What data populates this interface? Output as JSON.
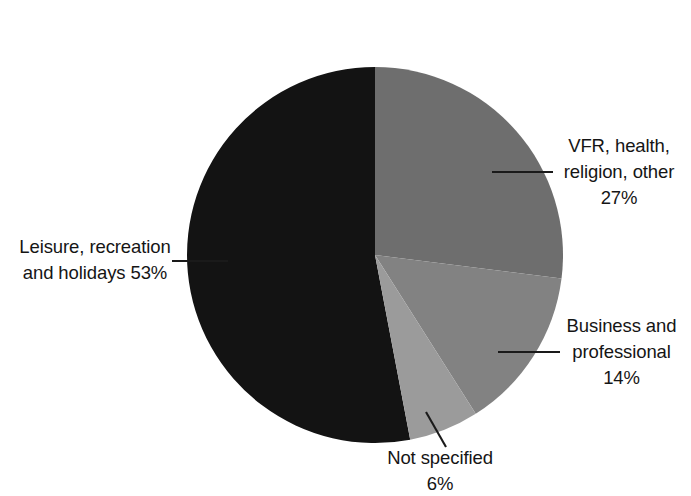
{
  "chart_data": {
    "type": "pie",
    "title": "",
    "subtitle": "",
    "xlabel": "",
    "ylabel": "",
    "legend_position": "none",
    "grid": false,
    "start_angle_deg": 0,
    "direction": "clockwise",
    "categories": [
      "VFR, health, religion, other",
      "Business and professional",
      "Not specified",
      "Leisure, recreation and holidays"
    ],
    "values": [
      27,
      14,
      6,
      53
    ],
    "value_unit": "%",
    "colors": [
      "#6e6e6e",
      "#828282",
      "#9b9b9b",
      "#131313"
    ],
    "slices": [
      {
        "name": "VFR, health, religion, other",
        "value": 27,
        "label": "VFR, health,\nreligion, other\n27%",
        "color": "#6e6e6e",
        "start_deg": 0,
        "end_deg": 97.2
      },
      {
        "name": "Business and professional",
        "value": 14,
        "label": "Business and\nprofessional\n14%",
        "color": "#828282",
        "start_deg": 97.2,
        "end_deg": 147.6
      },
      {
        "name": "Not specified",
        "value": 6,
        "label": "Not specified\n6%",
        "color": "#9b9b9b",
        "start_deg": 147.6,
        "end_deg": 169.2
      },
      {
        "name": "Leisure, recreation and holidays",
        "value": 53,
        "label": "Leisure, recreation\nand holidays 53%",
        "color": "#131313",
        "start_deg": 169.2,
        "end_deg": 360
      }
    ]
  },
  "labels": {
    "vfr": "VFR, health,\nreligion, other\n27%",
    "business": "Business and\nprofessional\n14%",
    "not_specified": "Not specified\n6%",
    "leisure": "Leisure, recreation\nand holidays 53%"
  },
  "style": {
    "background": "#ffffff",
    "text_color": "#151515",
    "leader_line_color": "#1a1a1a"
  }
}
